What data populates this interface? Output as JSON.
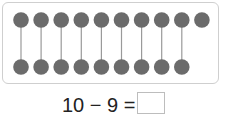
{
  "figure": {
    "top_row_count": 10,
    "bottom_row_count": 9,
    "paired_count": 9,
    "dot_color": "#6b6b6b",
    "line_color": "#9a9a9a",
    "frame_border_color": "#cfcfcf"
  },
  "equation": {
    "minuend": "10",
    "operator": "−",
    "subtrahend": "9",
    "equals": "=",
    "answer": "",
    "display": "10 − 9 ="
  }
}
